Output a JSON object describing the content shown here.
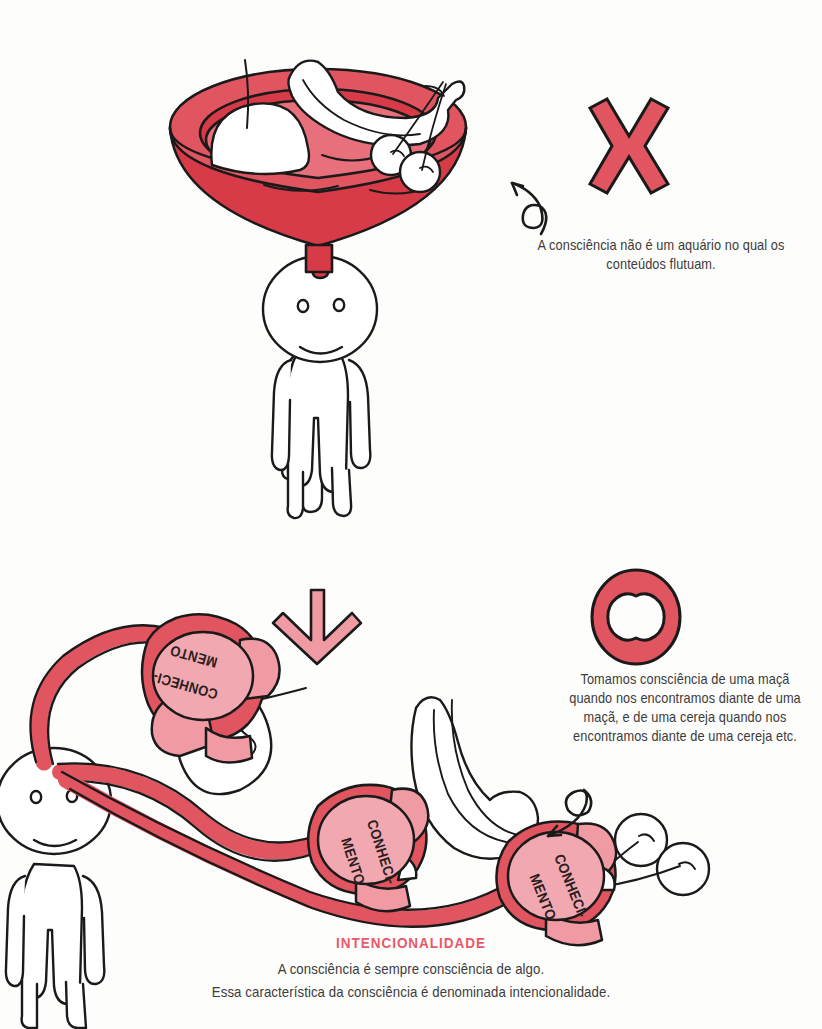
{
  "page": {
    "background_color": "#fdfdfc",
    "width": 822,
    "height": 1029
  },
  "palette": {
    "red_dark": "#d63b47",
    "red_mid": "#e0555f",
    "pink_mid": "#e8707c",
    "pink_light": "#f09aa3",
    "pink_pale": "#f2a8b0",
    "ink": "#1a1a1a",
    "text": "#3b3b3b",
    "accent_text": "#e8596b",
    "white": "#ffffff"
  },
  "top_panel": {
    "symbol": "X",
    "symbol_name": "cross-mark",
    "symbol_color": "#e0555f",
    "caption": "A consciência não é um aquário no qual os conteúdos flutuam.",
    "bowl_label": "aquarium-bowl",
    "fruits": [
      "apple",
      "banana",
      "cherries"
    ],
    "figure_label": "standing-person-with-bowl-head"
  },
  "transition": {
    "arrow_name": "down-arrow",
    "arrow_color": "#f09aa3"
  },
  "bottom_panel": {
    "symbol": "O",
    "symbol_name": "circle-mark",
    "symbol_color": "#e0555f",
    "caption": "Tomamos consciência de uma maçã quando nos encontramos diante de uma maçã, e de uma cereja quando nos encontramos diante de uma cereja etc.",
    "figure_label": "standing-person-with-tentacles",
    "fruits": [
      "apple",
      "banana",
      "cherries"
    ],
    "hands": [
      {
        "line1": "CONHECI-",
        "line2": "MENTO"
      },
      {
        "line1": "CONHECI-",
        "line2": "MENTO"
      },
      {
        "line1": "CONHECI-",
        "line2": "MENTO"
      }
    ]
  },
  "footer": {
    "title": "INTENCIONALIDADE",
    "line1": "A consciência é sempre consciência de algo.",
    "line2": "Essa característica da consciência é denominada intencionalidade."
  }
}
